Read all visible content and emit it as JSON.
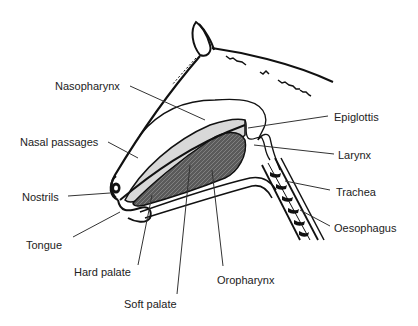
{
  "diagram": {
    "labels": [
      {
        "id": "nasopharynx",
        "text": "Nasopharynx",
        "x": 55,
        "y": 80
      },
      {
        "id": "nasal-passages",
        "text": "Nasal passages",
        "x": 20,
        "y": 136
      },
      {
        "id": "nostrils",
        "text": "Nostrils",
        "x": 22,
        "y": 191
      },
      {
        "id": "tongue",
        "text": "Tongue",
        "x": 26,
        "y": 239
      },
      {
        "id": "hard-palate",
        "text": "Hard palate",
        "x": 74,
        "y": 266
      },
      {
        "id": "soft-palate",
        "text": "Soft palate",
        "x": 124,
        "y": 298
      },
      {
        "id": "oropharynx",
        "text": "Oropharynx",
        "x": 217,
        "y": 274
      },
      {
        "id": "epiglottis",
        "text": "Epiglottis",
        "x": 334,
        "y": 111
      },
      {
        "id": "larynx",
        "text": "Larynx",
        "x": 338,
        "y": 149
      },
      {
        "id": "trachea",
        "text": "Trachea",
        "x": 336,
        "y": 186
      },
      {
        "id": "oesophagus",
        "text": "Oesophagus",
        "x": 334,
        "y": 222
      }
    ],
    "colors": {
      "outline": "#111111",
      "nasal_fill": "#d8d8d8",
      "tongue_fill": "#555555",
      "leader_line": "#333333",
      "text": "#222222"
    }
  }
}
